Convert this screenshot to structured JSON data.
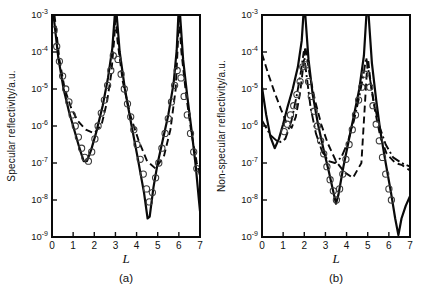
{
  "figure": {
    "background": "#ffffff",
    "line_color": "#0a0a0a",
    "marker_color": "#3c3c3c"
  },
  "chart_data": [
    {
      "id": "a",
      "type": "line",
      "caption": "(a)",
      "xlabel": "L",
      "ylabel": "Specular reflectivity/a.u.",
      "xlim": [
        0,
        7
      ],
      "x_tick_labels": [
        "0",
        "1",
        "2",
        "3",
        "4",
        "5",
        "6",
        "7"
      ],
      "y_scale": "log10",
      "y_tick_exponents": [
        -3,
        -4,
        -5,
        -6,
        -7,
        -8,
        -9
      ],
      "ylim_exponents": [
        -9,
        -3
      ],
      "grid": false,
      "legend": "none",
      "plot_box": {
        "left": 52,
        "top": 15,
        "right": 200,
        "bottom": 237
      },
      "series": [
        {
          "name": "model-solid",
          "type": "line",
          "style": "solid",
          "color": "#0a0a0a",
          "width": 2.2,
          "points": [
            [
              0.07,
              -3.0
            ],
            [
              0.3,
              -4.15
            ],
            [
              0.55,
              -5.0
            ],
            [
              0.8,
              -5.6
            ],
            [
              1.05,
              -6.1
            ],
            [
              1.3,
              -6.6
            ],
            [
              1.5,
              -6.95
            ],
            [
              1.65,
              -6.95
            ],
            [
              1.85,
              -6.65
            ],
            [
              2.1,
              -6.15
            ],
            [
              2.4,
              -5.45
            ],
            [
              2.65,
              -4.7
            ],
            [
              2.85,
              -3.9
            ],
            [
              2.97,
              -3.0
            ],
            [
              3.06,
              -3.0
            ],
            [
              3.2,
              -4.0
            ],
            [
              3.45,
              -5.0
            ],
            [
              3.75,
              -5.95
            ],
            [
              4.05,
              -6.85
            ],
            [
              4.35,
              -7.8
            ],
            [
              4.52,
              -8.5
            ],
            [
              4.62,
              -8.45
            ],
            [
              4.8,
              -7.65
            ],
            [
              5.0,
              -7.0
            ],
            [
              5.25,
              -6.35
            ],
            [
              5.5,
              -5.7
            ],
            [
              5.75,
              -4.85
            ],
            [
              5.9,
              -3.95
            ],
            [
              5.98,
              -3.0
            ],
            [
              6.06,
              -3.0
            ],
            [
              6.2,
              -4.2
            ],
            [
              6.4,
              -5.2
            ],
            [
              6.6,
              -6.1
            ],
            [
              6.8,
              -7.1
            ],
            [
              6.95,
              -8.0
            ],
            [
              7.0,
              -8.3
            ]
          ]
        },
        {
          "name": "model-dashed",
          "type": "line",
          "style": "dashed",
          "dash": "7 4",
          "color": "#0a0a0a",
          "width": 1.9,
          "points": [
            [
              0.12,
              -3.0
            ],
            [
              0.35,
              -4.2
            ],
            [
              0.6,
              -5.0
            ],
            [
              0.9,
              -5.5
            ],
            [
              1.2,
              -5.85
            ],
            [
              1.6,
              -6.1
            ],
            [
              2.0,
              -6.2
            ],
            [
              2.35,
              -5.95
            ],
            [
              2.6,
              -5.35
            ],
            [
              2.8,
              -4.6
            ],
            [
              2.95,
              -3.6
            ],
            [
              3.0,
              -3.0
            ],
            [
              3.1,
              -3.7
            ],
            [
              3.35,
              -4.8
            ],
            [
              3.7,
              -5.7
            ],
            [
              4.1,
              -6.4
            ],
            [
              4.5,
              -6.95
            ],
            [
              4.9,
              -7.15
            ],
            [
              5.3,
              -6.8
            ],
            [
              5.6,
              -6.1
            ],
            [
              5.85,
              -5.0
            ],
            [
              5.95,
              -3.8
            ],
            [
              6.0,
              -3.0
            ],
            [
              6.12,
              -4.0
            ],
            [
              6.35,
              -5.2
            ],
            [
              6.6,
              -6.2
            ],
            [
              6.85,
              -7.0
            ],
            [
              7.0,
              -7.35
            ]
          ]
        },
        {
          "name": "experimental-circles",
          "type": "scatter",
          "marker": "circle",
          "color": "#3c3c3c",
          "radius": 3.1,
          "stroke_width": 1.1,
          "points": [
            [
              0.1,
              -3.4
            ],
            [
              0.22,
              -3.85
            ],
            [
              0.35,
              -4.25
            ],
            [
              0.5,
              -4.65
            ],
            [
              0.65,
              -5.0
            ],
            [
              0.8,
              -5.35
            ],
            [
              0.95,
              -5.7
            ],
            [
              1.1,
              -6.0
            ],
            [
              1.25,
              -6.3
            ],
            [
              1.4,
              -6.6
            ],
            [
              1.55,
              -6.85
            ],
            [
              1.72,
              -6.95
            ],
            [
              1.88,
              -6.7
            ],
            [
              2.03,
              -6.35
            ],
            [
              2.18,
              -6.0
            ],
            [
              2.33,
              -5.65
            ],
            [
              2.48,
              -5.3
            ],
            [
              2.63,
              -4.9
            ],
            [
              2.78,
              -4.5
            ],
            [
              2.9,
              -4.1
            ],
            [
              3.12,
              -4.2
            ],
            [
              3.27,
              -4.6
            ],
            [
              3.42,
              -5.0
            ],
            [
              3.57,
              -5.4
            ],
            [
              3.72,
              -5.75
            ],
            [
              3.87,
              -6.1
            ],
            [
              4.02,
              -6.5
            ],
            [
              4.17,
              -6.9
            ],
            [
              4.32,
              -7.3
            ],
            [
              4.47,
              -7.7
            ],
            [
              4.6,
              -8.05
            ],
            [
              4.75,
              -7.8
            ],
            [
              4.9,
              -7.4
            ],
            [
              5.05,
              -7.0
            ],
            [
              5.2,
              -6.6
            ],
            [
              5.35,
              -6.2
            ],
            [
              5.5,
              -5.8
            ],
            [
              5.65,
              -5.35
            ],
            [
              5.8,
              -4.9
            ],
            [
              5.92,
              -4.5
            ],
            [
              6.1,
              -4.7
            ],
            [
              6.25,
              -5.2
            ],
            [
              6.4,
              -5.7
            ],
            [
              6.55,
              -6.2
            ],
            [
              6.7,
              -6.7
            ],
            [
              6.85,
              -7.15
            ]
          ]
        }
      ]
    },
    {
      "id": "b",
      "type": "line",
      "caption": "(b)",
      "xlabel": "L",
      "ylabel": "Non-specular reflectivity/a.u.",
      "xlim": [
        0,
        7
      ],
      "x_tick_labels": [
        "0",
        "1",
        "2",
        "3",
        "4",
        "5",
        "6",
        "7"
      ],
      "y_scale": "log10",
      "y_tick_exponents": [
        -3,
        -4,
        -5,
        -6,
        -7,
        -8,
        -9
      ],
      "ylim_exponents": [
        -9,
        -3
      ],
      "grid": false,
      "legend": "none",
      "plot_box": {
        "left": 262,
        "top": 15,
        "right": 410,
        "bottom": 237
      },
      "series": [
        {
          "name": "model-solid",
          "type": "line",
          "style": "solid",
          "color": "#0a0a0a",
          "width": 2.2,
          "points": [
            [
              0.0,
              -4.95
            ],
            [
              0.2,
              -5.7
            ],
            [
              0.4,
              -6.3
            ],
            [
              0.6,
              -6.6
            ],
            [
              0.8,
              -6.35
            ],
            [
              1.0,
              -5.95
            ],
            [
              1.2,
              -5.5
            ],
            [
              1.45,
              -5.0
            ],
            [
              1.7,
              -4.4
            ],
            [
              1.88,
              -3.7
            ],
            [
              1.96,
              -3.0
            ],
            [
              2.05,
              -3.0
            ],
            [
              2.2,
              -4.2
            ],
            [
              2.4,
              -5.15
            ],
            [
              2.65,
              -5.95
            ],
            [
              2.9,
              -6.6
            ],
            [
              3.15,
              -7.2
            ],
            [
              3.38,
              -7.8
            ],
            [
              3.5,
              -8.1
            ],
            [
              3.62,
              -7.85
            ],
            [
              3.85,
              -7.1
            ],
            [
              4.1,
              -6.4
            ],
            [
              4.35,
              -5.7
            ],
            [
              4.6,
              -5.0
            ],
            [
              4.82,
              -4.1
            ],
            [
              4.94,
              -3.0
            ],
            [
              5.04,
              -3.0
            ],
            [
              5.2,
              -4.3
            ],
            [
              5.4,
              -5.3
            ],
            [
              5.6,
              -6.15
            ],
            [
              5.85,
              -7.0
            ],
            [
              6.1,
              -7.8
            ],
            [
              6.3,
              -8.5
            ],
            [
              6.45,
              -8.95
            ],
            [
              6.6,
              -8.5
            ],
            [
              6.8,
              -8.15
            ],
            [
              7.0,
              -7.9
            ]
          ]
        },
        {
          "name": "model-dashed",
          "type": "line",
          "style": "dashed",
          "dash": "7 4",
          "color": "#0a0a0a",
          "width": 1.9,
          "points": [
            [
              0.0,
              -4.05
            ],
            [
              0.3,
              -4.6
            ],
            [
              0.6,
              -5.1
            ],
            [
              0.9,
              -5.55
            ],
            [
              1.15,
              -5.9
            ],
            [
              1.4,
              -6.05
            ],
            [
              1.6,
              -5.75
            ],
            [
              1.8,
              -5.1
            ],
            [
              1.95,
              -4.4
            ],
            [
              2.05,
              -3.85
            ],
            [
              2.25,
              -4.6
            ],
            [
              2.5,
              -5.3
            ],
            [
              2.8,
              -5.95
            ],
            [
              3.1,
              -6.45
            ],
            [
              3.5,
              -6.95
            ],
            [
              3.9,
              -7.25
            ],
            [
              4.3,
              -7.4
            ],
            [
              4.7,
              -7.0
            ],
            [
              4.85,
              -5.6
            ],
            [
              4.95,
              -4.6
            ],
            [
              5.02,
              -4.2
            ],
            [
              5.15,
              -4.9
            ],
            [
              5.35,
              -5.6
            ],
            [
              5.6,
              -6.3
            ],
            [
              5.9,
              -6.75
            ],
            [
              6.3,
              -7.0
            ],
            [
              6.6,
              -7.05
            ],
            [
              7.0,
              -7.2
            ]
          ]
        },
        {
          "name": "model-dashdot",
          "type": "line",
          "style": "dashdot",
          "dash": "9 3 2 3",
          "color": "#0a0a0a",
          "width": 1.9,
          "points": [
            [
              0.0,
              -5.85
            ],
            [
              0.4,
              -6.25
            ],
            [
              0.8,
              -6.45
            ],
            [
              1.1,
              -6.35
            ],
            [
              1.4,
              -5.85
            ],
            [
              1.65,
              -5.15
            ],
            [
              1.85,
              -4.5
            ],
            [
              1.97,
              -4.0
            ],
            [
              2.1,
              -4.6
            ],
            [
              2.3,
              -5.5
            ],
            [
              2.55,
              -6.2
            ],
            [
              2.85,
              -6.7
            ],
            [
              3.15,
              -6.95
            ],
            [
              3.45,
              -7.0
            ],
            [
              3.75,
              -6.85
            ],
            [
              4.05,
              -6.45
            ],
            [
              4.35,
              -5.85
            ],
            [
              4.6,
              -5.2
            ],
            [
              4.8,
              -4.6
            ],
            [
              4.93,
              -4.15
            ],
            [
              5.1,
              -4.7
            ],
            [
              5.3,
              -5.4
            ],
            [
              5.55,
              -6.0
            ],
            [
              5.85,
              -6.5
            ],
            [
              6.2,
              -6.85
            ],
            [
              6.6,
              -7.0
            ],
            [
              7.0,
              -7.1
            ]
          ]
        },
        {
          "name": "experimental-circles",
          "type": "scatter",
          "marker": "circle",
          "color": "#3c3c3c",
          "radius": 3.1,
          "stroke_width": 1.1,
          "points": [
            [
              1.05,
              -6.15
            ],
            [
              1.2,
              -5.95
            ],
            [
              1.35,
              -5.7
            ],
            [
              1.5,
              -5.45
            ],
            [
              1.65,
              -5.15
            ],
            [
              1.8,
              -4.8
            ],
            [
              1.93,
              -4.4
            ],
            [
              2.07,
              -4.35
            ],
            [
              2.2,
              -4.8
            ],
            [
              2.33,
              -5.2
            ],
            [
              2.47,
              -5.6
            ],
            [
              2.62,
              -6.0
            ],
            [
              2.77,
              -6.4
            ],
            [
              2.92,
              -6.75
            ],
            [
              3.07,
              -7.1
            ],
            [
              3.22,
              -7.45
            ],
            [
              3.37,
              -7.75
            ],
            [
              3.52,
              -8.0
            ],
            [
              3.67,
              -7.7
            ],
            [
              3.82,
              -7.3
            ],
            [
              3.97,
              -6.9
            ],
            [
              4.12,
              -6.5
            ],
            [
              4.27,
              -6.1
            ],
            [
              4.42,
              -5.7
            ],
            [
              4.57,
              -5.3
            ],
            [
              4.72,
              -4.95
            ],
            [
              4.87,
              -4.6
            ],
            [
              5.1,
              -4.95
            ],
            [
              5.25,
              -5.45
            ],
            [
              5.4,
              -5.95
            ],
            [
              5.55,
              -6.4
            ],
            [
              5.7,
              -6.85
            ],
            [
              5.85,
              -7.3
            ],
            [
              6.0,
              -7.7
            ],
            [
              6.12,
              -8.0
            ]
          ]
        }
      ]
    }
  ]
}
